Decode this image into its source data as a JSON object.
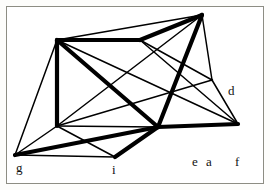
{
  "figure": {
    "kind": "planar-graph-drawing",
    "background_color": "#ffffff",
    "frame_color": "#8d8d83",
    "edge_color": "#000000",
    "label_color": "#111111",
    "canvas": {
      "width": 270,
      "height": 190
    }
  },
  "vertices": [
    {
      "id": "A",
      "x": 57,
      "y": 40
    },
    {
      "id": "B",
      "x": 140,
      "y": 40
    },
    {
      "id": "C",
      "x": 202,
      "y": 15
    },
    {
      "id": "D",
      "x": 212,
      "y": 80
    },
    {
      "id": "E",
      "x": 238,
      "y": 124
    },
    {
      "id": "F",
      "x": 158,
      "y": 127
    },
    {
      "id": "H",
      "x": 57,
      "y": 126
    },
    {
      "id": "I",
      "x": 115,
      "y": 157
    },
    {
      "id": "G",
      "x": 15,
      "y": 155
    }
  ],
  "edges": [
    {
      "from": "A",
      "to": "B",
      "weight": "thick"
    },
    {
      "from": "B",
      "to": "C",
      "weight": "thick"
    },
    {
      "from": "C",
      "to": "D",
      "weight": "thin"
    },
    {
      "from": "C",
      "to": "F",
      "weight": "thick"
    },
    {
      "from": "C",
      "to": "H",
      "weight": "thin"
    },
    {
      "from": "C",
      "to": "A",
      "weight": "thin"
    },
    {
      "from": "B",
      "to": "D",
      "weight": "thin"
    },
    {
      "from": "B",
      "to": "E",
      "weight": "thin"
    },
    {
      "from": "D",
      "to": "E",
      "weight": "thin"
    },
    {
      "from": "D",
      "to": "H",
      "weight": "thin"
    },
    {
      "from": "A",
      "to": "H",
      "weight": "thick"
    },
    {
      "from": "A",
      "to": "G",
      "weight": "thin"
    },
    {
      "from": "A",
      "to": "F",
      "weight": "thick"
    },
    {
      "from": "A",
      "to": "E",
      "weight": "thin"
    },
    {
      "from": "H",
      "to": "G",
      "weight": "thin"
    },
    {
      "from": "H",
      "to": "I",
      "weight": "thin"
    },
    {
      "from": "H",
      "to": "F",
      "weight": "thin"
    },
    {
      "from": "G",
      "to": "I",
      "weight": "thin"
    },
    {
      "from": "G",
      "to": "F",
      "weight": "thick"
    },
    {
      "from": "I",
      "to": "F",
      "weight": "thick"
    },
    {
      "from": "F",
      "to": "E",
      "weight": "thick"
    }
  ],
  "labels": [
    {
      "name": "label-d",
      "text": "d",
      "x": 228,
      "y": 84
    },
    {
      "name": "label-g",
      "text": "g",
      "x": 16,
      "y": 161
    },
    {
      "name": "label-i",
      "text": "i",
      "x": 112,
      "y": 163
    },
    {
      "name": "label-e",
      "text": "e",
      "x": 192,
      "y": 155
    },
    {
      "name": "label-a",
      "text": "a",
      "x": 206,
      "y": 155
    },
    {
      "name": "label-f",
      "text": "f",
      "x": 235,
      "y": 155
    }
  ],
  "stroke_widths": {
    "thin": 1.5,
    "thick": 4.2
  }
}
